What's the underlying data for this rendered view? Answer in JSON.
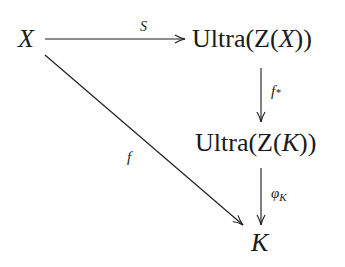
{
  "diagram": {
    "type": "commutative-diagram",
    "nodes": {
      "x": {
        "text": "X"
      },
      "ultra_zx": {
        "prefix": "Ultra(Z(",
        "var": "X",
        "suffix": "))"
      },
      "ultra_zk": {
        "prefix": "Ultra(Z(",
        "var": "K",
        "suffix": "))"
      },
      "k": {
        "text": "K"
      }
    },
    "edges": {
      "s": {
        "from": "X",
        "to": "Ultra(Z(X))",
        "label": "S"
      },
      "f_star": {
        "from": "Ultra(Z(X))",
        "to": "Ultra(Z(K))",
        "label": "f",
        "label_sub": "*"
      },
      "phi_k": {
        "from": "Ultra(Z(K))",
        "to": "K",
        "label": "φ",
        "label_sub": "K"
      },
      "f": {
        "from": "X",
        "to": "K",
        "label": "f"
      }
    },
    "colors": {
      "ink": "#1a1a1a",
      "background": "#ffffff"
    }
  }
}
